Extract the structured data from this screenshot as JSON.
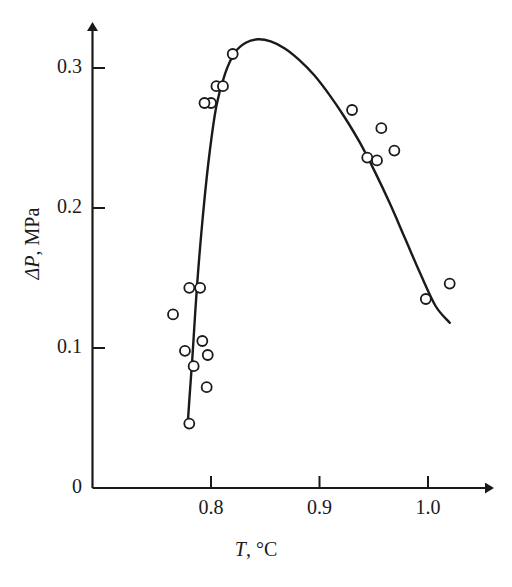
{
  "chart_data": {
    "type": "scatter",
    "title": "",
    "subtitle": "",
    "xlabel": "T, °C",
    "ylabel": "ΔP, MPa",
    "xlabel_parts": {
      "symbol": "T",
      "unit": ", °C"
    },
    "ylabel_parts": {
      "symbol": "ΔP",
      "unit": ", MPa"
    },
    "xlim": [
      0.745,
      1.037
    ],
    "ylim": [
      0.0,
      0.334
    ],
    "xticks": [
      0.8,
      0.9,
      1.0
    ],
    "xticklabels": [
      "0.8",
      "0.9",
      "1.0"
    ],
    "yticks": [
      0,
      0.1,
      0.2,
      0.3
    ],
    "yticklabels": [
      "0",
      "0.1",
      "0.2",
      "0.3"
    ],
    "grid": false,
    "legend": null,
    "axis_style": "arrow-tipped L-shaped axes, open-circle markers, single smooth fitted curve",
    "marker": {
      "shape": "open-circle",
      "radius_px": 5,
      "fill": "#ffffff",
      "stroke": "#1a1a1a"
    },
    "colors": {
      "axis": "#1a1a1a",
      "curve": "#1a1a1a",
      "marker_edge": "#1a1a1a",
      "marker_face": "#ffffff",
      "background": "#ffffff"
    },
    "series": [
      {
        "name": "measured points",
        "type": "scatter",
        "x": [
          0.765,
          0.776,
          0.78,
          0.784,
          0.78,
          0.792,
          0.797,
          0.796,
          0.8,
          0.79,
          0.794,
          0.805,
          0.811,
          0.82,
          0.93,
          0.944,
          0.953,
          0.957,
          0.969,
          0.998,
          1.02
        ],
        "y": [
          0.124,
          0.098,
          0.046,
          0.087,
          0.143,
          0.105,
          0.095,
          0.072,
          0.275,
          0.143,
          0.275,
          0.287,
          0.287,
          0.31,
          0.27,
          0.236,
          0.234,
          0.257,
          0.241,
          0.135,
          0.146
        ]
      },
      {
        "name": "fitted curve",
        "type": "line",
        "x": [
          0.7785,
          0.7805,
          0.783,
          0.787,
          0.792,
          0.798,
          0.805,
          0.813,
          0.822,
          0.832,
          0.843,
          0.855,
          0.868,
          0.881,
          0.895,
          0.909,
          0.923,
          0.937,
          0.951,
          0.965,
          0.979,
          0.993,
          1.007,
          1.02
        ],
        "y": [
          0.0455,
          0.068,
          0.095,
          0.143,
          0.19,
          0.235,
          0.273,
          0.296,
          0.311,
          0.318,
          0.3205,
          0.319,
          0.314,
          0.306,
          0.295,
          0.281,
          0.265,
          0.247,
          0.226,
          0.203,
          0.178,
          0.153,
          0.13,
          0.118
        ]
      }
    ],
    "annotations": [],
    "peak": {
      "x": 0.845,
      "y": 0.321
    }
  },
  "axes": {
    "y_ticks": [
      {
        "label": "0.3",
        "value": 0.3
      },
      {
        "label": "0.2",
        "value": 0.2
      },
      {
        "label": "0.1",
        "value": 0.1
      },
      {
        "label": "0",
        "value": 0
      }
    ],
    "x_ticks": [
      {
        "label": "0.8",
        "value": 0.8
      },
      {
        "label": "0.9",
        "value": 0.9
      },
      {
        "label": "1.0",
        "value": 1.0
      }
    ]
  },
  "labels": {
    "y_title_symbol": "ΔP",
    "y_title_unit": ", MPa",
    "x_title_symbol": "T",
    "x_title_unit": ", °C"
  }
}
